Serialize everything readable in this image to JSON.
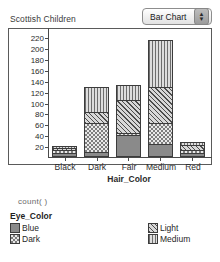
{
  "header": {
    "title": "Scottish Children",
    "chart_type_value": "Bar Chart",
    "stepper_up": "▲",
    "stepper_down": "▼"
  },
  "legend": {
    "count_label": "count(  )",
    "title": "Eye_Color"
  },
  "chart_data": {
    "type": "bar",
    "stacked": true,
    "title": "Scottish Children",
    "xlabel": "Hair_Color",
    "ylabel": "Frequency of Hair_Color",
    "ylim": [
      0,
      228
    ],
    "yticks": [
      20,
      40,
      60,
      80,
      100,
      120,
      140,
      160,
      180,
      200,
      220
    ],
    "grid": false,
    "legend_position": "below",
    "legend_title": "Eye_Color",
    "categories": [
      "Black",
      "Dark",
      "Fair",
      "Medium",
      "Red"
    ],
    "series": [
      {
        "name": "Blue",
        "pattern": "solid-gray",
        "values": [
          4,
          6,
          36,
          20,
          3
        ]
      },
      {
        "name": "Dark",
        "pattern": "checkerboard",
        "values": [
          6,
          53,
          4,
          38,
          5
        ]
      },
      {
        "name": "Light",
        "pattern": "diagonal-hatch",
        "values": [
          3,
          21,
          62,
          68,
          9
        ]
      },
      {
        "name": "Medium",
        "pattern": "vertical-stripe",
        "values": [
          2,
          45,
          26,
          86,
          6
        ]
      }
    ],
    "totals": [
      15,
      125,
      128,
      212,
      23
    ]
  }
}
